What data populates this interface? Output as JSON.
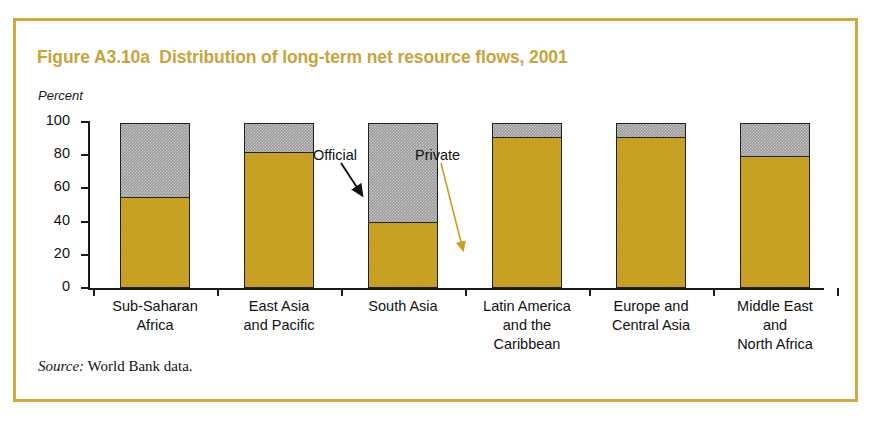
{
  "figure": {
    "title": "Figure A3.10a  Distribution of long-term net resource flows, 2001",
    "unit_label": "Percent",
    "source_prefix": "Source:",
    "source_text": " World Bank data.",
    "frame_color": "#d0a93f",
    "title_color": "#c9a33c"
  },
  "annotations": [
    {
      "label": "Official",
      "arrow_color": "#111111"
    },
    {
      "label": "Private",
      "arrow_color": "#c8a021"
    }
  ],
  "chart_data": {
    "type": "bar",
    "title": "Figure A3.10a  Distribution of long-term net resource flows, 2001",
    "subtitle": "",
    "xlabel": "",
    "ylabel": "Percent",
    "ylim": [
      0,
      100
    ],
    "yticks": [
      0,
      20,
      40,
      60,
      80,
      100
    ],
    "ytick_labels": [
      "0",
      "20",
      "40",
      "60",
      "80",
      "100"
    ],
    "grid": false,
    "legend": "annotated",
    "stacked": true,
    "categories": [
      "Sub-Saharan\nAfrica",
      "East Asia\nand Pacific",
      "South Asia",
      "Latin America\nand the\nCaribbean",
      "Europe and\nCentral Asia",
      "Middle East\nand\nNorth Africa"
    ],
    "category_lines": [
      [
        "Sub-Saharan",
        "Africa"
      ],
      [
        "East Asia",
        "and Pacific"
      ],
      [
        "South Asia"
      ],
      [
        "Latin America",
        "and the",
        "Caribbean"
      ],
      [
        "Europe and",
        "Central Asia"
      ],
      [
        "Middle East",
        "and",
        "North Africa"
      ]
    ],
    "series": [
      {
        "name": "Private",
        "color": "#c8a021",
        "values": [
          55,
          82,
          40,
          91,
          91,
          80
        ]
      },
      {
        "name": "Official",
        "color": "#9b9b9b",
        "values": [
          45,
          18,
          60,
          9,
          9,
          20
        ]
      }
    ]
  }
}
